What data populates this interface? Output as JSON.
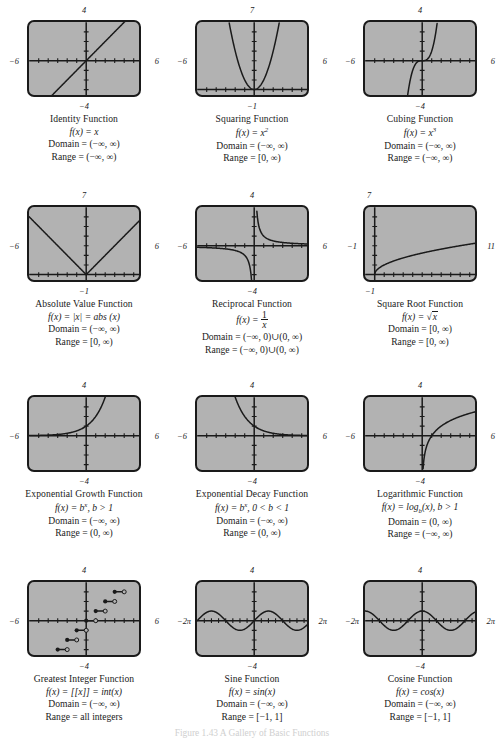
{
  "figure_caption": "Figure 1.43   A Gallery of Basic Functions",
  "colors": {
    "plot_fill": "#b2b2b2",
    "ink": "#1a1a1a",
    "page": "#ffffff"
  },
  "chart_data": [
    {
      "type": "line",
      "name": "identity",
      "title": "Identity Function",
      "formula": "f(x) = x",
      "domain": "Domain = (−∞, ∞)",
      "range": "Range = (−∞, ∞)",
      "axis_labels": {
        "top": "4",
        "bottom": "−4",
        "left": "−6",
        "right": "6"
      },
      "xlim": [
        -6,
        6
      ],
      "ylim": [
        -4,
        4
      ],
      "grid": false,
      "x": [
        -4,
        4
      ],
      "y": [
        -4,
        4
      ]
    },
    {
      "type": "line",
      "name": "squaring",
      "title": "Squaring Function",
      "formula": "f(x) = x²",
      "domain": "Domain = (−∞, ∞)",
      "range": "Range = [0, ∞)",
      "axis_labels": {
        "top": "7",
        "bottom": "−1",
        "left": "−6",
        "right": "6"
      },
      "xlim": [
        -6,
        6
      ],
      "ylim": [
        -1,
        7
      ],
      "grid": false,
      "x": [
        -2.65,
        -2,
        -1.5,
        -1,
        -0.5,
        0,
        0.5,
        1,
        1.5,
        2,
        2.65
      ],
      "y": [
        7.02,
        4,
        2.25,
        1,
        0.25,
        0,
        0.25,
        1,
        2.25,
        4,
        7.02
      ]
    },
    {
      "type": "line",
      "name": "cubing",
      "title": "Cubing Function",
      "formula": "f(x) = x³",
      "domain": "Domain = (−∞, ∞)",
      "range": "Range = (−∞, ∞)",
      "axis_labels": {
        "top": "4",
        "bottom": "−4",
        "left": "−6",
        "right": "6"
      },
      "xlim": [
        -6,
        6
      ],
      "ylim": [
        -4,
        4
      ],
      "grid": false,
      "x": [
        -1.59,
        -1.2,
        -0.8,
        -0.4,
        0,
        0.4,
        0.8,
        1.2,
        1.59
      ],
      "y": [
        -4.02,
        -1.73,
        -0.51,
        -0.06,
        0,
        0.06,
        0.51,
        1.73,
        4.02
      ]
    },
    {
      "type": "line",
      "name": "absolute-value",
      "title": "Absolute Value Function",
      "formula": "f(x) = |x| = abs (x)",
      "domain": "Domain = (−∞, ∞)",
      "range": "Range = [0, ∞)",
      "axis_labels": {
        "top": "7",
        "bottom": "−1",
        "left": "−6",
        "right": "6"
      },
      "xlim": [
        -6,
        6
      ],
      "ylim": [
        -1,
        7
      ],
      "grid": false,
      "x": [
        -5.4,
        0,
        5.4
      ],
      "y": [
        5.4,
        0,
        5.4
      ]
    },
    {
      "type": "line",
      "name": "reciprocal",
      "title": "Reciprocal Function",
      "formula": "f(x) = 1/x",
      "domain": "Domain = (−∞, 0)∪(0, ∞)",
      "range": "Range = (−∞, 0)∪(0, ∞)",
      "axis_labels": {
        "top": "4",
        "bottom": "−4",
        "left": "−6",
        "right": "6"
      },
      "xlim": [
        -6,
        6
      ],
      "ylim": [
        -4,
        4
      ],
      "grid": false,
      "branches": [
        {
          "x": [
            -6,
            -4,
            -3,
            -2,
            -1,
            -0.5,
            -0.28
          ],
          "y": [
            -0.167,
            -0.25,
            -0.333,
            -0.5,
            -1,
            -2,
            -3.6
          ]
        },
        {
          "x": [
            0.28,
            0.5,
            1,
            2,
            3,
            4,
            6
          ],
          "y": [
            3.6,
            2,
            1,
            0.5,
            0.333,
            0.25,
            0.167
          ]
        }
      ]
    },
    {
      "type": "line",
      "name": "square-root",
      "title": "Square Root Function",
      "formula": "f(x) = √x",
      "domain": "Domain = [0, ∞)",
      "range": "Range = [0, ∞)",
      "axis_labels": {
        "top": "7",
        "bottom": "−1",
        "left": "−1",
        "right": "11"
      },
      "xlim": [
        -1,
        11
      ],
      "ylim": [
        -1,
        7
      ],
      "grid": false,
      "x": [
        0,
        0.5,
        1,
        2,
        3,
        4,
        5,
        6,
        7,
        8,
        9,
        10
      ],
      "y": [
        0,
        0.707,
        1,
        1.414,
        1.732,
        2,
        2.236,
        2.449,
        2.646,
        2.828,
        3,
        3.162
      ]
    },
    {
      "type": "line",
      "name": "exponential-growth",
      "title": "Exponential Growth Function",
      "formula": "f(x) = bˣ, b > 1",
      "domain": "Domain = (−∞, ∞)",
      "range": "Range = (0, ∞)",
      "axis_labels": {
        "top": "4",
        "bottom": "−4",
        "left": "−6",
        "right": "6"
      },
      "xlim": [
        -6,
        6
      ],
      "ylim": [
        -4,
        4
      ],
      "grid": false,
      "x": [
        -6,
        -4,
        -3,
        -2,
        -1,
        0,
        0.5,
        1,
        1.26
      ],
      "y": [
        0.016,
        0.063,
        0.125,
        0.25,
        0.5,
        1,
        1.41,
        2,
        4
      ]
    },
    {
      "type": "line",
      "name": "exponential-decay",
      "title": "Exponential Decay Function",
      "formula": "f(x) = bˣ, 0 < b < 1",
      "domain": "Domain = (−∞, ∞)",
      "range": "Range = (0, ∞)",
      "axis_labels": {
        "top": "4",
        "bottom": "−4",
        "left": "−6",
        "right": "6"
      },
      "xlim": [
        -6,
        6
      ],
      "ylim": [
        -4,
        4
      ],
      "grid": false,
      "x": [
        -2.0,
        -1.5,
        -1,
        -0.5,
        0,
        1,
        2,
        3,
        4,
        6
      ],
      "y": [
        4,
        2.83,
        2,
        1.41,
        1,
        0.5,
        0.25,
        0.125,
        0.063,
        0.016
      ]
    },
    {
      "type": "line",
      "name": "logarithmic",
      "title": "Logarithmic Function",
      "formula": "f(x) = log_b(x), b > 1",
      "domain": "Domain = (0, ∞)",
      "range": "Range = (−∞, ∞)",
      "axis_labels": {
        "top": "4",
        "bottom": "−4",
        "left": "−6",
        "right": "6"
      },
      "xlim": [
        -6,
        6
      ],
      "ylim": [
        -4,
        4
      ],
      "grid": false,
      "x": [
        0.0625,
        0.125,
        0.25,
        0.5,
        1,
        2,
        3,
        4,
        5,
        6
      ],
      "y": [
        -4,
        -3,
        -2,
        -1,
        0,
        1,
        1.585,
        2,
        2.322,
        2.585
      ]
    },
    {
      "type": "step",
      "name": "greatest-integer",
      "title": "Greatest Integer Function",
      "formula": "f(x) = [[x]] = int(x)",
      "domain": "Domain = (−∞, ∞)",
      "range": "Range = all integers",
      "axis_labels": {
        "top": "4",
        "bottom": "−4",
        "left": "−6",
        "right": "6"
      },
      "xlim": [
        -6,
        6
      ],
      "ylim": [
        -4,
        4
      ],
      "grid": false,
      "steps": [
        {
          "x0": -3,
          "x1": -2,
          "y": -3
        },
        {
          "x0": -2,
          "x1": -1,
          "y": -2
        },
        {
          "x0": -1,
          "x1": 0,
          "y": -1
        },
        {
          "x0": 0,
          "x1": 1,
          "y": 0
        },
        {
          "x0": 1,
          "x1": 2,
          "y": 1
        },
        {
          "x0": 2,
          "x1": 3,
          "y": 2
        },
        {
          "x0": 3,
          "x1": 4,
          "y": 3
        }
      ]
    },
    {
      "type": "line",
      "name": "sine",
      "title": "Sine Function",
      "formula": "f(x) = sin(x)",
      "domain": "Domain = (−∞, ∞)",
      "range": "Range = [−1, 1]",
      "axis_labels": {
        "top": "4",
        "bottom": "−4",
        "left": "−2π",
        "right": "2π"
      },
      "xlim": [
        -6.2832,
        6.2832
      ],
      "ylim": [
        -4,
        4
      ],
      "grid": false,
      "amplitude": 1,
      "period": 6.2832
    },
    {
      "type": "line",
      "name": "cosine",
      "title": "Cosine Function",
      "formula": "f(x) = cos(x)",
      "domain": "Domain = (−∞, ∞)",
      "range": "Range = [−1, 1]",
      "axis_labels": {
        "top": "4",
        "bottom": "−4",
        "left": "−2π",
        "right": "2π"
      },
      "xlim": [
        -6.2832,
        6.2832
      ],
      "ylim": [
        -4,
        4
      ],
      "grid": false,
      "amplitude": 1,
      "period": 6.2832
    }
  ]
}
